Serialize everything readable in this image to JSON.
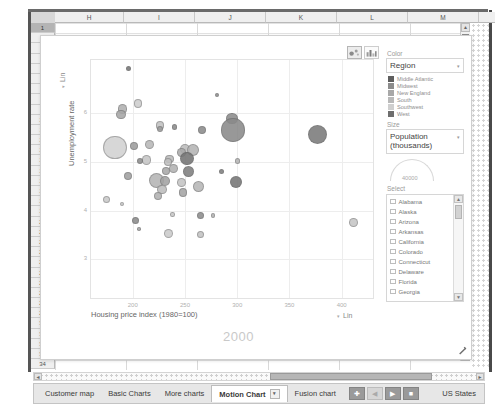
{
  "spreadsheet": {
    "column_headers": [
      "H",
      "I",
      "J",
      "K",
      "L",
      "M"
    ],
    "row_numbers": [
      "1",
      "2",
      "3",
      "4",
      "5",
      "6",
      "7",
      "8",
      "9",
      "10",
      "11",
      "12",
      "13",
      "14",
      "15",
      "16",
      "17",
      "18",
      "19",
      "20",
      "21",
      "22",
      "23",
      "24",
      "25",
      "26",
      "27",
      "28",
      "29",
      "30",
      "31",
      "32",
      "33",
      "34"
    ],
    "selected_row": "1",
    "scroll_up_icon": "▲",
    "scroll_down_icon": "▼",
    "scroll_left_icon": "◄",
    "scroll_right_icon": "►"
  },
  "chart": {
    "toolbar": {
      "bubble_chart_icon": "bubble-chart-icon",
      "bar_chart_icon": "bar-chart-icon"
    },
    "year_watermark": "2000",
    "y_axis": {
      "label": "Unemployment rate",
      "scale": "Lin",
      "scale_caret": "▾",
      "ticks": [
        "6",
        "5",
        "4",
        "3"
      ],
      "ticks_full": [
        "7",
        "6",
        "5",
        "4",
        "3"
      ]
    },
    "x_axis": {
      "label": "Housing price index (1980=100)",
      "scale": "Lin",
      "scale_caret": "▾",
      "ticks": [
        "200",
        "250",
        "300",
        "350",
        "400"
      ]
    },
    "resize_grip_icon": "resize-grip-icon"
  },
  "chart_data": {
    "type": "scatter",
    "title": "",
    "xlabel": "Housing price index (1980=100)",
    "ylabel": "Unemployment rate",
    "xlim": [
      160,
      430
    ],
    "ylim": [
      2.2,
      7.1
    ],
    "xticks": [
      200,
      250,
      300,
      350,
      400
    ],
    "yticks": [
      3,
      4,
      5,
      6
    ],
    "grid": true,
    "legend_position": "right",
    "size_encoding": "Population (thousands)",
    "color_encoding": "Region",
    "year": "2000",
    "points": [
      {
        "x": 196,
        "y": 6.92,
        "r": 2.6,
        "c": "#787878"
      },
      {
        "x": 281,
        "y": 6.38,
        "r": 2.0,
        "c": "#8f8f8f"
      },
      {
        "x": 205,
        "y": 6.2,
        "r": 4.4,
        "c": "#cdcdcd"
      },
      {
        "x": 190,
        "y": 6.09,
        "r": 4.6,
        "c": "#b0b0b0"
      },
      {
        "x": 189,
        "y": 5.98,
        "r": 4.8,
        "c": "#a6a6a6"
      },
      {
        "x": 295,
        "y": 5.9,
        "r": 5.6,
        "c": "#8c8c8c"
      },
      {
        "x": 296,
        "y": 5.66,
        "r": 11.6,
        "c": "#8a8a8a"
      },
      {
        "x": 226,
        "y": 5.75,
        "r": 4.4,
        "c": "#c2c2c2"
      },
      {
        "x": 226,
        "y": 5.68,
        "r": 3.4,
        "c": "#9e9e9e"
      },
      {
        "x": 240,
        "y": 5.72,
        "r": 2.6,
        "c": "#8b8b8b"
      },
      {
        "x": 266,
        "y": 5.66,
        "r": 4.0,
        "c": "#8c8c8c"
      },
      {
        "x": 377,
        "y": 5.56,
        "r": 9.6,
        "c": "#7a7a7a"
      },
      {
        "x": 183,
        "y": 5.3,
        "r": 11.6,
        "c": "#d2d2d2"
      },
      {
        "x": 216,
        "y": 5.36,
        "r": 4.6,
        "c": "#b8b8b8"
      },
      {
        "x": 201,
        "y": 5.33,
        "r": 4.0,
        "c": "#9d9d9d"
      },
      {
        "x": 250,
        "y": 5.26,
        "r": 5.0,
        "c": "#bdbdbd"
      },
      {
        "x": 258,
        "y": 5.24,
        "r": 6.0,
        "c": "#b5b5b5"
      },
      {
        "x": 247,
        "y": 5.2,
        "r": 4.4,
        "c": "#a9a9a9"
      },
      {
        "x": 252,
        "y": 5.08,
        "r": 6.6,
        "c": "#747474"
      },
      {
        "x": 235,
        "y": 5.06,
        "r": 4.4,
        "c": "#bababa"
      },
      {
        "x": 234,
        "y": 5.0,
        "r": 4.0,
        "c": "#c0c0c0"
      },
      {
        "x": 213,
        "y": 5.04,
        "r": 4.6,
        "c": "#c6c6c6"
      },
      {
        "x": 207,
        "y": 5.02,
        "r": 3.0,
        "c": "#8e8e8e"
      },
      {
        "x": 300,
        "y": 5.02,
        "r": 2.6,
        "c": "#b6b6b6"
      },
      {
        "x": 239,
        "y": 4.86,
        "r": 4.6,
        "c": "#b2b2b2"
      },
      {
        "x": 232,
        "y": 4.82,
        "r": 4.0,
        "c": "#a8a8a8"
      },
      {
        "x": 253,
        "y": 4.8,
        "r": 5.6,
        "c": "#7f7f7f"
      },
      {
        "x": 285,
        "y": 4.8,
        "r": 2.6,
        "c": "#808080"
      },
      {
        "x": 195,
        "y": 4.72,
        "r": 4.0,
        "c": "#a0a0a0"
      },
      {
        "x": 223,
        "y": 4.62,
        "r": 7.6,
        "c": "#b4b4b4"
      },
      {
        "x": 231,
        "y": 4.6,
        "r": 5.0,
        "c": "#a2a2a2"
      },
      {
        "x": 247,
        "y": 4.58,
        "r": 4.6,
        "c": "#c4c4c4"
      },
      {
        "x": 299,
        "y": 4.58,
        "r": 6.0,
        "c": "#767676"
      },
      {
        "x": 263,
        "y": 4.5,
        "r": 5.6,
        "c": "#b7b7b7"
      },
      {
        "x": 228,
        "y": 4.44,
        "r": 4.6,
        "c": "#bcbcbc"
      },
      {
        "x": 248,
        "y": 4.38,
        "r": 4.4,
        "c": "#a4a4a4"
      },
      {
        "x": 224,
        "y": 4.3,
        "r": 4.0,
        "c": "#b1b1b1"
      },
      {
        "x": 175,
        "y": 4.22,
        "r": 3.6,
        "c": "#cacaca"
      },
      {
        "x": 190,
        "y": 4.14,
        "r": 2.0,
        "c": "#c8c8c8"
      },
      {
        "x": 238,
        "y": 3.92,
        "r": 2.2,
        "c": "#c7c7c7"
      },
      {
        "x": 265,
        "y": 3.9,
        "r": 3.6,
        "c": "#8d8d8d"
      },
      {
        "x": 277,
        "y": 3.9,
        "r": 2.2,
        "c": "#b3b3b3"
      },
      {
        "x": 203,
        "y": 3.8,
        "r": 3.6,
        "c": "#8b8b8b"
      },
      {
        "x": 411,
        "y": 3.76,
        "r": 4.4,
        "c": "#c5c5c5"
      },
      {
        "x": 206,
        "y": 3.62,
        "r": 1.8,
        "c": "#a7a7a7"
      },
      {
        "x": 234,
        "y": 3.52,
        "r": 4.6,
        "c": "#cbcbcb"
      },
      {
        "x": 265,
        "y": 3.5,
        "r": 3.6,
        "c": "#c3c3c3"
      }
    ]
  },
  "controls": {
    "color": {
      "label": "Color",
      "value": "Region",
      "caret": "▾",
      "legend": [
        {
          "name": "Middle Atlantic",
          "color": "#5e5e5e"
        },
        {
          "name": "Midwest",
          "color": "#8c8c8c"
        },
        {
          "name": "New England",
          "color": "#a8a8a8"
        },
        {
          "name": "South",
          "color": "#b9b9b9"
        },
        {
          "name": "Southwest",
          "color": "#cfcfcf"
        },
        {
          "name": "West",
          "color": "#6e6e6e"
        }
      ]
    },
    "size": {
      "label": "Size",
      "value": "Population (thousands)",
      "caret": "▾",
      "gauge_value": "40000"
    },
    "select": {
      "label": "Select",
      "items": [
        "Alabama",
        "Alaska",
        "Arizona",
        "Arkansas",
        "California",
        "Colorado",
        "Connecticut",
        "Delaware",
        "Florida",
        "Georgia"
      ],
      "scroll_up_icon": "▲",
      "scroll_down_icon": "▼"
    }
  },
  "tabs": {
    "items": [
      {
        "label": "Customer map",
        "active": false
      },
      {
        "label": "Basic Charts",
        "active": false
      },
      {
        "label": "More charts",
        "active": false
      },
      {
        "label": "Motion Chart",
        "active": true
      },
      {
        "label": "Fusion chart",
        "active": false
      }
    ],
    "active_caret": "▾",
    "controls": [
      {
        "icon": "✚",
        "name": "add-sheet-button",
        "light": false
      },
      {
        "icon": "◀",
        "name": "prev-sheet-button",
        "light": true
      },
      {
        "icon": "▶",
        "name": "next-sheet-button",
        "light": false
      },
      {
        "icon": "■",
        "name": "all-sheets-button",
        "light": false
      }
    ],
    "sheet_name": "US States"
  }
}
